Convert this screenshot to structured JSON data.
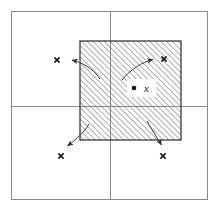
{
  "figure": {
    "caption": "",
    "background_color": "#ffffff",
    "width": 222,
    "height": 211
  },
  "outer_frame": {
    "label": "outer bounding rectangle",
    "x": 11,
    "y": 11,
    "width": 197,
    "height": 189,
    "stroke_color": "#8a8a8a",
    "stroke_width": 1
  },
  "axes": {
    "vertical_line": {
      "label": "vertical dividing line",
      "x": 110,
      "y1": 11,
      "y2": 200,
      "stroke_color": "#8a8a8a",
      "stroke_width": 1
    },
    "horizontal_line": {
      "label": "horizontal dividing line",
      "y": 106,
      "x1": 11,
      "x2": 208,
      "stroke_color": "#8a8a8a",
      "stroke_width": 1
    }
  },
  "hatched_region": {
    "label": "hatched square neighbourhood",
    "x": 80,
    "y": 41,
    "width": 101,
    "height": 99,
    "stroke_color": "#2b2b2b",
    "stroke_width": 1.2,
    "hatch_color": "#6e6e6e",
    "hatch_angle_degrees": 45,
    "hatch_spacing": 4
  },
  "center_point": {
    "label": "x",
    "dot_x": 134,
    "dot_y": 88,
    "dot_radius": 2.3,
    "dot_color": "#1a1a1a",
    "label_x": 146,
    "label_y": 92,
    "halo_color": "#ffffff"
  },
  "arrows": [
    {
      "name": "arrow-top-left",
      "path": "M 100,79 C 96,73 88,64 72,60",
      "arrow_tip_x": 66,
      "arrow_tip_y": 60,
      "arrow_angle_degrees": 186,
      "marker_x": 57,
      "marker_y": 60,
      "marker_label": "x",
      "stroke_color": "#3a3a3a",
      "stroke_width": 1
    },
    {
      "name": "arrow-top-right",
      "path": "M 122,80 C 130,70 142,62 152,60",
      "arrow_tip_x": 157,
      "arrow_tip_y": 59,
      "arrow_angle_degrees": 345,
      "marker_x": 164,
      "marker_y": 59,
      "marker_label": "x",
      "stroke_color": "#3a3a3a",
      "stroke_width": 1
    },
    {
      "name": "arrow-bottom-left",
      "path": "M 89,124 C 84,133 75,140 68,145",
      "arrow_tip_x": 64,
      "arrow_tip_y": 148,
      "arrow_angle_degrees": 126,
      "marker_x": 61,
      "marker_y": 156,
      "marker_label": "x",
      "stroke_color": "#3a3a3a",
      "stroke_width": 1
    },
    {
      "name": "arrow-bottom-right",
      "path": "M 147,121 C 152,130 158,139 161,144",
      "arrow_tip_x": 163,
      "arrow_tip_y": 148,
      "arrow_angle_degrees": 62,
      "marker_x": 163,
      "marker_y": 156,
      "marker_label": "x",
      "stroke_color": "#3a3a3a",
      "stroke_width": 1
    }
  ],
  "markers": {
    "glyph": "x",
    "size": 5,
    "color": "#1a1a1a"
  }
}
